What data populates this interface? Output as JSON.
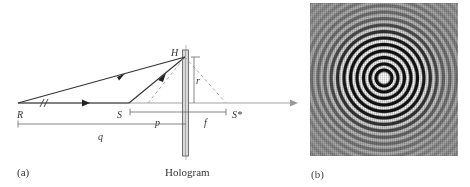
{
  "figure_a": {
    "panel_label": "(a)",
    "points": {
      "R": "R",
      "S": "S",
      "H": "H",
      "S_star": "S*"
    },
    "distances": {
      "p": "p",
      "q": "q",
      "f": "f",
      "r": "r"
    },
    "plate_label": "Hologram",
    "break_mark": "//"
  },
  "figure_b": {
    "panel_label": "(b)",
    "description": "Concentric-ring interference pattern (Fresnel zone plate hologram)"
  },
  "colors": {
    "line": "#333333",
    "dashed": "#aaaaaa",
    "axis": "#999999",
    "plate_fill": "#d8d8d8",
    "pattern_bg": "#9a9a9a"
  }
}
